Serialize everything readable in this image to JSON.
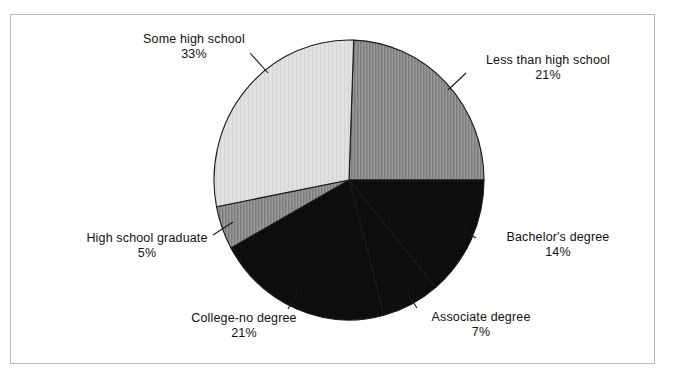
{
  "chart_data": {
    "type": "pie",
    "title": "",
    "subtitle": "",
    "xlabel": "",
    "ylabel": "",
    "legend_position": "none",
    "grid": false,
    "label_format": "name + percent",
    "units": "percent",
    "total": 101,
    "categories": [
      "Less than high school",
      "Bachelor's degree",
      "Associate degree",
      "College-no degree",
      "High school graduate",
      "Some high school"
    ],
    "values": [
      21,
      14,
      7,
      21,
      5,
      33
    ],
    "slices": [
      {
        "label": "Less than high school",
        "percent": 21,
        "percent_text": "21%",
        "color": "#8c8c8c",
        "start_angle": 2,
        "sweep_angle": 88
      },
      {
        "label": "Bachelor's degree",
        "percent": 14,
        "percent_text": "14%",
        "color": "#0d0d0d",
        "start_angle": 90,
        "sweep_angle": 50
      },
      {
        "label": "Associate degree",
        "percent": 7,
        "percent_text": "7%",
        "color": "#0d0d0d",
        "start_angle": 140,
        "sweep_angle": 25
      },
      {
        "label": "College-no degree",
        "percent": 21,
        "percent_text": "21%",
        "color": "#0d0d0d",
        "start_angle": 165,
        "sweep_angle": 76
      },
      {
        "label": "High school graduate",
        "percent": 5,
        "percent_text": "5%",
        "color": "#8c8c8c",
        "start_angle": 241,
        "sweep_angle": 18
      },
      {
        "label": "Some high school",
        "percent": 33,
        "percent_text": "33%",
        "color": "#dedede",
        "start_angle": 259,
        "sweep_angle": 103
      }
    ]
  },
  "labels": {
    "some_high_school": {
      "name": "Some high school",
      "percent": "33%"
    },
    "less_than_high_school": {
      "name": "Less than high school",
      "percent": "21%"
    },
    "bachelors_degree": {
      "name": "Bachelor's degree",
      "percent": "14%"
    },
    "associate_degree": {
      "name": "Associate degree",
      "percent": "7%"
    },
    "college_no_degree": {
      "name": "College-no degree",
      "percent": "21%"
    },
    "high_school_graduate": {
      "name": "High school graduate",
      "percent": "5%"
    }
  },
  "style": {
    "background": "#ffffff",
    "frame_border": "#b9b9b9",
    "text_color": "#111111",
    "slice_outline": "#1a1a1a",
    "leader_line": "#1a1a1a",
    "color_light_gray": "#dedede",
    "color_medium_gray": "#8c8c8c",
    "color_black": "#0d0d0d"
  },
  "geometry": {
    "center_x": 349,
    "center_y": 180,
    "radius_x": 135,
    "radius_y": 140
  }
}
